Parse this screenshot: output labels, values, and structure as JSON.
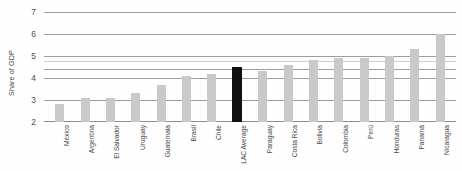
{
  "chart_data": {
    "type": "bar",
    "title": "",
    "xlabel": "",
    "ylabel": "Share of GDP",
    "ylim": [
      2,
      7
    ],
    "yticks": [
      2,
      3,
      4,
      5,
      6,
      7
    ],
    "ytick_labels": [
      "2",
      "3",
      "4",
      "5",
      "6",
      "7"
    ],
    "grid": true,
    "legend": "none",
    "categories": [
      "México",
      "Argentina",
      "El Salvador",
      "Uruguay",
      "Guatemala",
      "Brasil",
      "Chile",
      "LAC Average",
      "Paraguay",
      "Costa Rica",
      "Bolivia",
      "Colombia",
      "Perú",
      "Honduras",
      "Panamá",
      "Nicaragua"
    ],
    "values": [
      2.8,
      3.1,
      3.1,
      3.3,
      3.7,
      4.1,
      4.2,
      4.5,
      4.3,
      4.6,
      4.8,
      4.9,
      4.9,
      5.0,
      5.3,
      6.0
    ],
    "highlight_category": "LAC Average",
    "bar_color": "#c9c9c9",
    "highlight_color": "#111111",
    "gridline_color": "#9d9d9d"
  }
}
